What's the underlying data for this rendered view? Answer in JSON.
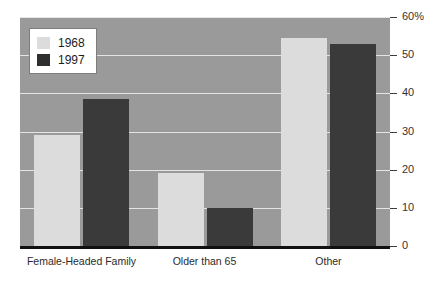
{
  "chart_data": {
    "type": "bar",
    "title": "",
    "subtitle": "",
    "xlabel": "",
    "ylabel": "",
    "categories": [
      "Female-Headed Family",
      "Older than 65",
      "Other"
    ],
    "series": [
      {
        "name": "1968",
        "color": "#dcdcdc",
        "values": [
          29,
          19,
          54.5
        ]
      },
      {
        "name": "1997",
        "color": "#3a3a3a",
        "values": [
          38.5,
          10,
          53
        ]
      }
    ],
    "ylim": [
      0,
      60
    ],
    "ytick_values": [
      0,
      10,
      20,
      30,
      40,
      50,
      60
    ],
    "ytick_labels": [
      "0",
      "10",
      "20",
      "30",
      "40",
      "50",
      "60%"
    ],
    "grid": true,
    "legend_position": "top-left",
    "plot_background": "#9a9a9a",
    "gridline_color": "#e4e4e4",
    "axis_color": "#111111"
  },
  "legend": {
    "entries": [
      {
        "label": "1968"
      },
      {
        "label": "1997"
      }
    ]
  }
}
